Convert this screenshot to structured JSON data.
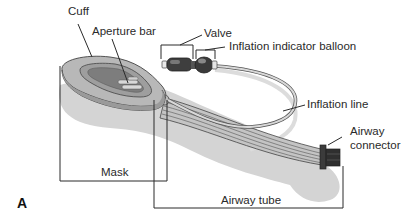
{
  "figure": {
    "panel_label": "A",
    "labels": {
      "cuff": "Cuff",
      "aperture_bar": "Aperture bar",
      "valve": "Valve",
      "inflation_indicator_balloon": "Inflation indicator balloon",
      "inflation_line": "Inflation line",
      "airway_connector_line1": "Airway",
      "airway_connector_line2": "connector",
      "mask": "Mask",
      "airway_tube": "Airway tube"
    },
    "colors": {
      "line": "#2a2a2a",
      "shadow": "#d4d4d4",
      "cuff": "#b5b5b5",
      "cuff_dark": "#8e8e8e",
      "tube": "#c9c9c9",
      "connector": "#3a3a3a"
    }
  }
}
